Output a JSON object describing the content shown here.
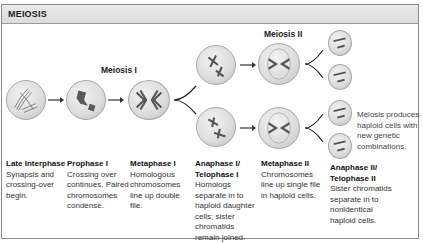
{
  "header": {
    "title": "MEIOSIS"
  },
  "stage_labels": {
    "meiosis_1": "Meiosis I",
    "meiosis_2": "Meiosis II"
  },
  "note": [
    "Meiosis produces",
    "haploid cells with",
    "new genetic",
    "combinations."
  ],
  "columns": [
    {
      "title": [
        "Late Interphase"
      ],
      "body": [
        "Synapsis and",
        "crossing-over",
        "begin."
      ]
    },
    {
      "title": [
        "Prophase I"
      ],
      "body": [
        "Crossing over",
        "continues. Paired",
        "chromosomes",
        "condense."
      ]
    },
    {
      "title": [
        "Metaphase I"
      ],
      "body": [
        "Homologous",
        "chromosomes",
        "line up double",
        "file."
      ]
    },
    {
      "title": [
        "Anaphase I/",
        "Telophase I"
      ],
      "body": [
        "Homologs",
        "separate in to",
        "haploid daughter",
        "cells;  sister",
        "chromatids",
        "remain joined."
      ]
    },
    {
      "title": [
        "Metaphase II"
      ],
      "body": [
        "Chromosomes",
        "line up single file",
        "in haploid cells."
      ]
    },
    {
      "title": [
        "Anaphase II/",
        "Telophase II"
      ],
      "body": [
        "Sister chromatids",
        "separate in to",
        "nonidentical",
        "haploid cells."
      ]
    }
  ],
  "colors": {
    "header_bg": "#e2e2e2",
    "border": "#8a8a8a",
    "cell": "#dcdcdc",
    "chromosome": "#5a5a5a"
  }
}
